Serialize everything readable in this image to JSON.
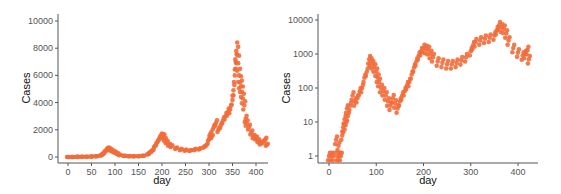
{
  "chart_data": [
    {
      "type": "scatter",
      "title": "",
      "xlabel": "day",
      "ylabel": "Cases",
      "yscale": "linear",
      "xlim": [
        -10,
        430
      ],
      "ylim": [
        0,
        10000
      ],
      "xticks": [
        0,
        50,
        100,
        150,
        200,
        250,
        300,
        350,
        400
      ],
      "yticks": [
        0,
        2000,
        4000,
        6000,
        8000,
        10000
      ],
      "grid": false,
      "legend": null,
      "marker_color": "#F26B3A",
      "series": [
        {
          "name": "cases",
          "x": [
            0,
            10,
            20,
            30,
            40,
            50,
            60,
            70,
            75,
            80,
            85,
            88,
            92,
            96,
            100,
            105,
            110,
            120,
            130,
            140,
            150,
            160,
            170,
            175,
            180,
            185,
            190,
            195,
            198,
            200,
            203,
            206,
            210,
            215,
            220,
            230,
            240,
            250,
            260,
            270,
            280,
            290,
            295,
            300,
            303,
            306,
            310,
            315,
            320,
            325,
            330,
            335,
            340,
            345,
            350,
            352,
            355,
            357,
            358,
            360,
            362,
            364,
            366,
            368,
            370,
            372,
            375,
            378,
            380,
            385,
            390,
            395,
            400,
            405,
            410,
            415,
            420,
            423
          ],
          "values": [
            0,
            5,
            10,
            15,
            20,
            30,
            50,
            120,
            250,
            450,
            650,
            600,
            500,
            420,
            350,
            250,
            150,
            80,
            60,
            50,
            60,
            90,
            200,
            350,
            500,
            800,
            1100,
            1400,
            1600,
            1500,
            1550,
            1300,
            1100,
            900,
            800,
            650,
            550,
            500,
            480,
            550,
            600,
            750,
            900,
            1300,
            1700,
            1500,
            2200,
            2500,
            2000,
            2300,
            2700,
            3000,
            3300,
            3500,
            4200,
            4900,
            6000,
            7000,
            7800,
            7500,
            6900,
            6000,
            5500,
            5200,
            4800,
            4300,
            3800,
            2800,
            2500,
            2200,
            1800,
            1500,
            1400,
            1200,
            1000,
            1100,
            1300,
            900
          ]
        }
      ]
    },
    {
      "type": "scatter",
      "title": "",
      "xlabel": "day",
      "ylabel": "Cases",
      "yscale": "log",
      "xlim": [
        -10,
        445
      ],
      "ylim": [
        0.6,
        12000
      ],
      "xticks": [
        0,
        100,
        200,
        300,
        400
      ],
      "yticks": [
        1,
        10,
        100,
        1000,
        10000
      ],
      "grid": false,
      "legend": null,
      "marker_color": "#F26B3A",
      "series": [
        {
          "name": "cases",
          "x": [
            0,
            5,
            10,
            15,
            18,
            20,
            22,
            25,
            28,
            30,
            33,
            35,
            38,
            40,
            45,
            50,
            55,
            60,
            65,
            70,
            75,
            80,
            85,
            88,
            92,
            96,
            100,
            103,
            106,
            110,
            115,
            120,
            125,
            130,
            135,
            140,
            145,
            150,
            155,
            160,
            165,
            170,
            175,
            180,
            185,
            190,
            195,
            200,
            205,
            210,
            215,
            220,
            230,
            240,
            250,
            260,
            270,
            280,
            290,
            300,
            305,
            310,
            320,
            330,
            340,
            350,
            355,
            360,
            365,
            370,
            375,
            380,
            390,
            400,
            410,
            415,
            420,
            423
          ],
          "values": [
            1,
            1,
            1,
            3,
            1,
            2,
            1,
            1,
            4,
            7,
            12,
            8,
            25,
            15,
            30,
            60,
            40,
            50,
            80,
            100,
            200,
            300,
            700,
            600,
            500,
            400,
            300,
            200,
            150,
            100,
            80,
            60,
            40,
            30,
            50,
            35,
            25,
            40,
            60,
            80,
            120,
            150,
            250,
            400,
            600,
            900,
            1200,
            1500,
            1400,
            1300,
            1000,
            800,
            600,
            550,
            500,
            500,
            550,
            650,
            800,
            1200,
            1800,
            2200,
            2500,
            2800,
            3000,
            3500,
            5000,
            7000,
            6000,
            5500,
            4000,
            2500,
            1500,
            1100,
            900,
            1000,
            1300,
            700
          ]
        }
      ]
    }
  ]
}
